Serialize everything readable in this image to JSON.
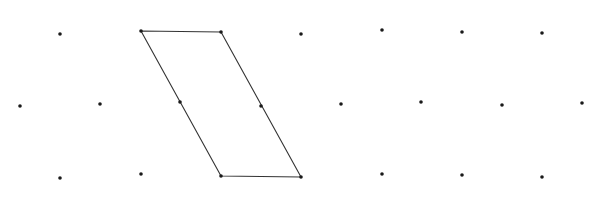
{
  "diagram": {
    "type": "isometric-dot-grid-with-parallelogram",
    "canvas": {
      "width": 597,
      "height": 212
    },
    "colors": {
      "background": "#ffffff",
      "dot": "#1a1a1a",
      "line": "#333333"
    },
    "dot_radius": 1.8,
    "line_width": 1.1,
    "grid_points": [
      [
        60,
        34
      ],
      [
        141,
        31
      ],
      [
        221,
        32
      ],
      [
        301,
        34
      ],
      [
        382,
        30
      ],
      [
        462,
        32
      ],
      [
        542,
        33
      ],
      [
        20,
        106
      ],
      [
        100,
        104
      ],
      [
        180,
        102
      ],
      [
        261,
        106
      ],
      [
        341,
        104
      ],
      [
        421,
        102
      ],
      [
        502,
        105
      ],
      [
        582,
        103
      ],
      [
        60,
        178
      ],
      [
        141,
        174
      ],
      [
        221,
        176
      ],
      [
        301,
        177
      ],
      [
        382,
        174
      ],
      [
        462,
        175
      ],
      [
        542,
        177
      ]
    ],
    "parallelogram": {
      "vertices": [
        [
          141,
          31
        ],
        [
          221,
          32
        ],
        [
          301,
          177
        ],
        [
          221,
          176
        ]
      ]
    }
  }
}
